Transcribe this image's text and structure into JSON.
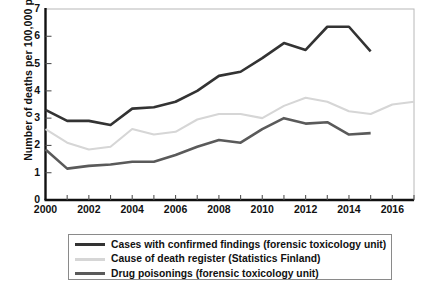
{
  "chart_data": {
    "type": "line",
    "title": "",
    "xlabel": "",
    "ylabel": "Number of deaths per 100,000 people",
    "xlim": [
      2000,
      2017
    ],
    "ylim": [
      0,
      7
    ],
    "yticks": [
      0,
      1,
      2,
      3,
      4,
      5,
      6,
      7
    ],
    "xticks": [
      2000,
      2001,
      2002,
      2003,
      2004,
      2005,
      2006,
      2007,
      2008,
      2009,
      2010,
      2011,
      2012,
      2013,
      2014,
      2015,
      2016,
      2017
    ],
    "xtick_labels": [
      "2000",
      "",
      "2002",
      "",
      "2004",
      "",
      "2006",
      "",
      "2008",
      "",
      "2010",
      "",
      "2012",
      "",
      "2014",
      "",
      "2016",
      ""
    ],
    "ytick_labels": [
      "0",
      "1",
      "2",
      "3",
      "4",
      "5",
      "6",
      "7"
    ],
    "grid": false,
    "legend_position": "below",
    "series": [
      {
        "name": "Cases with confirmed findings (forensic toxicology unit)",
        "color": "#333333",
        "x": [
          2000,
          2001,
          2002,
          2003,
          2004,
          2005,
          2006,
          2007,
          2008,
          2009,
          2010,
          2011,
          2012,
          2013,
          2014,
          2015
        ],
        "values": [
          3.3,
          2.9,
          2.9,
          2.75,
          3.35,
          3.4,
          3.6,
          4.0,
          4.55,
          4.7,
          5.2,
          5.75,
          5.5,
          6.35,
          6.35,
          5.45
        ]
      },
      {
        "name": "Cause of death register (Statistics Finland)",
        "color": "#d6d6d6",
        "x": [
          2000,
          2001,
          2002,
          2003,
          2004,
          2005,
          2006,
          2007,
          2008,
          2009,
          2010,
          2011,
          2012,
          2013,
          2014,
          2015,
          2016,
          2017
        ],
        "values": [
          2.6,
          2.1,
          1.85,
          1.95,
          2.6,
          2.4,
          2.5,
          2.95,
          3.15,
          3.15,
          3.0,
          3.45,
          3.75,
          3.6,
          3.25,
          3.15,
          3.5,
          3.6
        ]
      },
      {
        "name": "Drug poisonings (forensic toxicology unit)",
        "color": "#5a5a5a",
        "x": [
          2000,
          2001,
          2002,
          2003,
          2004,
          2005,
          2006,
          2007,
          2008,
          2009,
          2010,
          2011,
          2012,
          2013,
          2014,
          2015
        ],
        "values": [
          1.85,
          1.15,
          1.25,
          1.3,
          1.4,
          1.4,
          1.65,
          1.95,
          2.2,
          2.1,
          2.6,
          3.0,
          2.8,
          2.85,
          2.4,
          2.45
        ]
      }
    ]
  },
  "legend": {
    "items": [
      {
        "label": "Cases with confirmed findings (forensic toxicology unit)",
        "color": "#333333"
      },
      {
        "label": "Cause of death register (Statistics Finland)",
        "color": "#d6d6d6"
      },
      {
        "label": "Drug poisonings (forensic toxicology unit)",
        "color": "#5a5a5a"
      }
    ]
  },
  "axes": {
    "y_title": "Number of deaths per 100,000 people"
  }
}
